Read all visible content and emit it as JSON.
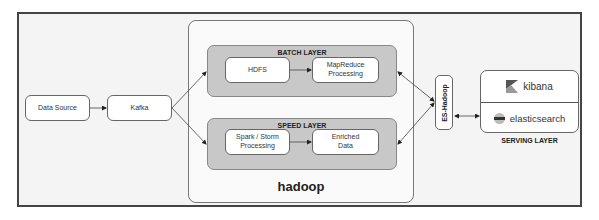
{
  "diagram": {
    "nodes": {
      "data_source": "Data Source",
      "kafka": "Kafka",
      "hadoop": "hadoop",
      "batch_layer": {
        "title": "BATCH LAYER",
        "hdfs": "HDFS",
        "mapreduce_line1": "MapReduce",
        "mapreduce_line2": "Processing"
      },
      "speed_layer": {
        "title": "SPEED LAYER",
        "spark_line1": "Spark / Storm",
        "spark_line2": "Processing",
        "enriched_line1": "Enriched",
        "enriched_line2": "Data"
      },
      "es_hadoop": "ES-Hadoop",
      "serving_layer": {
        "title": "SERVING LAYER",
        "kibana": "kibana",
        "elasticsearch": "elasticsearch"
      }
    },
    "edges": [
      {
        "from": "Data Source",
        "to": "Kafka"
      },
      {
        "from": "Kafka",
        "to": "BATCH LAYER"
      },
      {
        "from": "Kafka",
        "to": "SPEED LAYER"
      },
      {
        "from": "HDFS",
        "to": "MapReduce Processing"
      },
      {
        "from": "Spark / Storm Processing",
        "to": "Enriched Data"
      },
      {
        "from": "ES-Hadoop",
        "to": "BATCH LAYER"
      },
      {
        "from": "ES-Hadoop",
        "to": "SPEED LAYER"
      },
      {
        "from": "ES-Hadoop",
        "to": "SERVING LAYER",
        "bidirectional": true
      }
    ],
    "colors": {
      "layer_fill": "#c8c8c8",
      "frame_border": "#444444",
      "box_fill": "#ffffff"
    }
  }
}
